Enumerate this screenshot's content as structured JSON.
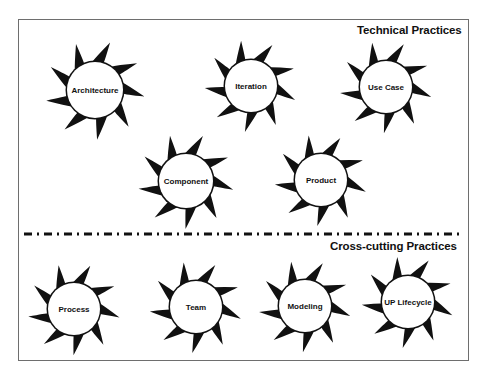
{
  "diagram": {
    "sections": [
      {
        "id": "technical",
        "title": "Technical Practices",
        "title_pos": [
          357,
          24
        ]
      },
      {
        "id": "crosscutting",
        "title": "Cross-cutting Practices",
        "title_pos": [
          330,
          240
        ]
      }
    ],
    "divider": {
      "style": "dash-dot",
      "y": 234,
      "x1": 24,
      "x2": 462,
      "color": "#111111"
    },
    "frame_color": "#6e6e6e",
    "star_color": "#111111",
    "practices": [
      {
        "label": "Architecture",
        "section": "technical",
        "cx": 95,
        "cy": 90,
        "r": 28,
        "rot": 5
      },
      {
        "label": "Iteration",
        "section": "technical",
        "cx": 251,
        "cy": 86,
        "r": 26,
        "rot": 15
      },
      {
        "label": "Use Case",
        "section": "technical",
        "cx": 386,
        "cy": 87,
        "r": 26,
        "rot": 10
      },
      {
        "label": "Component",
        "section": "technical",
        "cx": 186,
        "cy": 181,
        "r": 27,
        "rot": 8
      },
      {
        "label": "Product",
        "section": "technical",
        "cx": 321,
        "cy": 180,
        "r": 26,
        "rot": 12
      },
      {
        "label": "Process",
        "section": "crosscutting",
        "cx": 74,
        "cy": 309,
        "r": 26,
        "rot": 8
      },
      {
        "label": "Team",
        "section": "crosscutting",
        "cx": 196,
        "cy": 307,
        "r": 26,
        "rot": 12
      },
      {
        "label": "Modeling",
        "section": "crosscutting",
        "cx": 305,
        "cy": 306,
        "r": 26,
        "rot": 10
      },
      {
        "label": "UP Lifecycle",
        "section": "crosscutting",
        "cx": 408,
        "cy": 302,
        "r": 26,
        "rot": 14
      }
    ]
  }
}
